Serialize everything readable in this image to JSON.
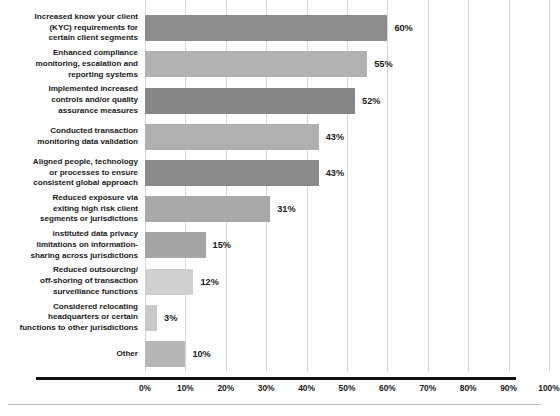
{
  "chart_data": {
    "type": "bar",
    "orientation": "horizontal",
    "title": "",
    "xlabel": "",
    "ylabel": "",
    "xlim": [
      0,
      100
    ],
    "grid": true,
    "legend": "none",
    "value_suffix": "%",
    "categories": [
      "Increased know your client (KYC) requirements for certain client segments",
      "Enhanced compliance monitoring, escalation and reporting systems",
      "Implemented increased controls and/or quality assurance measures",
      "Conducted transaction monitoring data validation",
      "Aligned people, technology or processes to ensure consistent global approach",
      "Reduced exposure via exiting high risk client segments or jurisdictions",
      "instituted data privacy limitations on information-sharing across jurisdictions",
      "Reduced outsourcing/ off-shoring of transaction surveillance functions",
      "Considered relocating headquarters or certain functions to other jurisdictions",
      "Other"
    ],
    "category_lines": [
      "Increased know your client\n(KYC) requirements for\ncertain client segments",
      "Enhanced compliance\nmonitoring, escalation and\nreporting systems",
      "Implemented increased\ncontrols and/or quality\nassurance measures",
      "Conducted transaction\nmonitoring data validation",
      "Aligned people, technology\nor processes to ensure\nconsistent global approach",
      "Reduced exposure via\nexiting high risk client\nsegments or jurisdictions",
      "instituted data privacy\nlimitations on information-\nsharing across jurisdictions",
      "Reduced outsourcing/\noff-shoring of transaction\nsurveillance functions",
      "Considered relocating\nheadquarters or certain\nfunctions to other jurisdictions",
      "Other"
    ],
    "values": [
      60,
      55,
      52,
      43,
      43,
      31,
      15,
      12,
      3,
      10
    ],
    "value_labels": [
      "60%",
      "55%",
      "52%",
      "43%",
      "43%",
      "31%",
      "15%",
      "12%",
      "3%",
      "10%"
    ],
    "bar_colors": [
      "#8c8c8c",
      "#b2b2b2",
      "#868686",
      "#b0b0b0",
      "#8b8b8b",
      "#a9a9a9",
      "#a4a4a4",
      "#cfcfcf",
      "#c9c9c9",
      "#b6b6b6"
    ],
    "tick_labels": [
      "0%",
      "10%",
      "20%",
      "30%",
      "40%",
      "50%",
      "60%",
      "70%",
      "80%",
      "90%",
      "100%"
    ],
    "tick_values": [
      0,
      10,
      20,
      30,
      40,
      50,
      60,
      70,
      80,
      90,
      100
    ],
    "axis_color": "#111111"
  }
}
